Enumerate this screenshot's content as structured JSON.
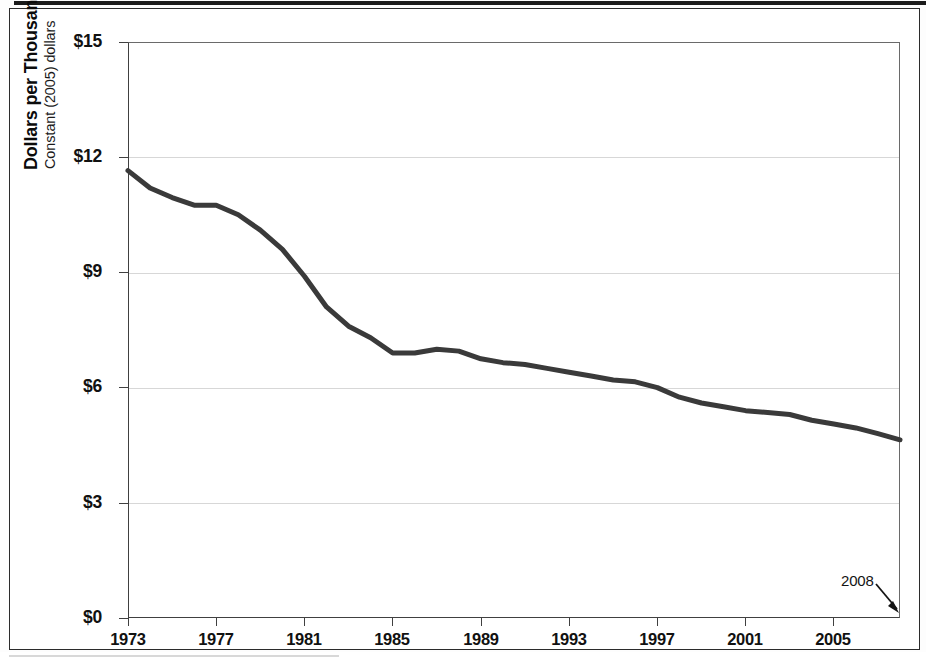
{
  "figure": {
    "frame_present": true,
    "background_color": "#ffffff",
    "border_color": "#2b2b2b",
    "top_rule_color": "#1b1b1b"
  },
  "axis": {
    "y_title_main": "Dollars per Thousand Btu",
    "y_title_sub": "Constant (2005) dollars",
    "y_ticklabels": [
      "$15",
      "$12",
      "$9",
      "$6",
      "$3",
      "$0"
    ],
    "x_ticklabels": [
      "1973",
      "1977",
      "1981",
      "1985",
      "1989",
      "1993",
      "1997",
      "2001",
      "2005"
    ]
  },
  "annotations": [
    {
      "text": "2008",
      "kind": "arrow-callout",
      "points_to": "series-end"
    }
  ],
  "chart_data": {
    "type": "line",
    "title": "",
    "subtitle": "",
    "xlabel": "",
    "ylabel": "Dollars per Thousand Btu",
    "ylabel_sub": "Constant (2005) dollars",
    "xlim": [
      1973,
      2008
    ],
    "ylim": [
      0,
      15
    ],
    "y_tick_values": [
      0,
      3,
      6,
      9,
      12,
      15
    ],
    "y_tick_labels": [
      "$0",
      "$3",
      "$6",
      "$9",
      "$12",
      "$15"
    ],
    "x_tick_values": [
      1973,
      1977,
      1981,
      1985,
      1989,
      1993,
      1997,
      2001,
      2005
    ],
    "x_tick_labels": [
      "1973",
      "1977",
      "1981",
      "1985",
      "1989",
      "1993",
      "1997",
      "2001",
      "2005"
    ],
    "grid": {
      "horizontal": true,
      "vertical": false,
      "color": "#d7d7d7"
    },
    "legend": {
      "visible": false,
      "position": "none"
    },
    "series": [
      {
        "name": "Price",
        "color": "#3a3a3a",
        "line_width": 5,
        "markers": false,
        "x": [
          1973,
          1974,
          1975,
          1976,
          1977,
          1978,
          1979,
          1980,
          1981,
          1982,
          1983,
          1984,
          1985,
          1986,
          1987,
          1988,
          1989,
          1990,
          1991,
          1992,
          1993,
          1994,
          1995,
          1996,
          1997,
          1998,
          1999,
          2000,
          2001,
          2002,
          2003,
          2004,
          2005,
          2006,
          2007,
          2008
        ],
        "values": [
          11.65,
          11.2,
          10.95,
          10.75,
          10.75,
          10.5,
          10.1,
          9.6,
          8.9,
          8.1,
          7.6,
          7.3,
          6.9,
          6.9,
          7.0,
          6.95,
          6.75,
          6.65,
          6.6,
          6.5,
          6.4,
          6.3,
          6.2,
          6.15,
          6.0,
          5.75,
          5.6,
          5.5,
          5.4,
          5.35,
          5.3,
          5.15,
          5.05,
          4.95,
          4.8,
          4.64
        ]
      }
    ]
  }
}
